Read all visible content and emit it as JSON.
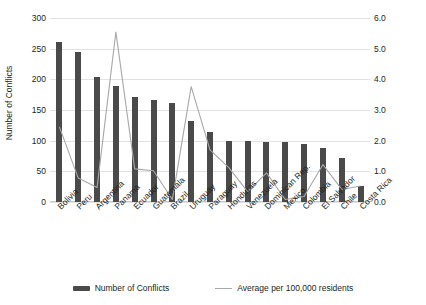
{
  "chart_data": {
    "type": "bar",
    "title": "",
    "xlabel": "",
    "ylabel": "Number of Conflicts",
    "y2label": "Average number of conflicts per 100,000 residents",
    "ylim": [
      0,
      300
    ],
    "y2lim": [
      0,
      6.0
    ],
    "grid": true,
    "legend_position": "bottom",
    "categories": [
      "Bolivia",
      "Peru",
      "Argentina",
      "Panama",
      "Ecuador",
      "Guatemala",
      "Brazil",
      "Uruguay",
      "Paraguay",
      "Honduras",
      "Venezuela",
      "Dominican Rep.",
      "Mexico",
      "Colombia",
      "El Salvador",
      "Chile",
      "Costa Rica"
    ],
    "yticks": [
      "0",
      "50",
      "100",
      "150",
      "200",
      "250",
      "300"
    ],
    "ytick_values": [
      0,
      50,
      100,
      150,
      200,
      250,
      300
    ],
    "y2ticks": [
      "0.0",
      "1.0",
      "2.0",
      "3.0",
      "4.0",
      "5.0",
      "6.0"
    ],
    "y2tick_values": [
      0,
      1,
      2,
      3,
      4,
      5,
      6
    ],
    "series": [
      {
        "name": "Number of Conflicts",
        "type": "bar",
        "axis": "left",
        "color": "#4a4a4a",
        "values": [
          261,
          244,
          204,
          189,
          172,
          167,
          161,
          132,
          114,
          99,
          99,
          98,
          98,
          95,
          88,
          71,
          26
        ]
      },
      {
        "name": "Average per 100,000 residents",
        "type": "line",
        "axis": "right",
        "color": "#a8a8a8",
        "values": [
          2.45,
          0.78,
          0.47,
          5.54,
          1.08,
          1.02,
          0.08,
          3.76,
          1.7,
          1.12,
          0.34,
          0.95,
          0.08,
          0.18,
          1.22,
          0.41,
          0.52
        ]
      }
    ],
    "legend": [
      {
        "label": "Number of Conflicts",
        "marker": "bar-swatch",
        "color": "#4a4a4a"
      },
      {
        "label": "Average per 100,000 residents",
        "marker": "line-swatch",
        "color": "#a8a8a8"
      }
    ]
  }
}
